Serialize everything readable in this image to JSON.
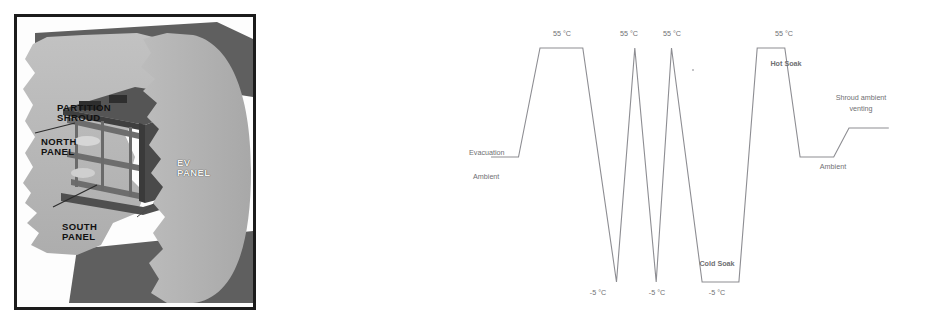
{
  "figure": {
    "panels": 2
  },
  "left_panel": {
    "name": "spacecraft-shroud-cutaway",
    "labels": {
      "partition_shroud": "PARTITION\nSHROUD",
      "north_panel": "NORTH\nPANEL",
      "ev_panel": "EV\nPANEL",
      "south_panel": "SOUTH\nPANEL",
      "front_shroud": "FRONT\nSHROUD"
    },
    "colors": {
      "frame": "#1b1b1b",
      "light_gray": "#b7b7b7",
      "mid_gray": "#9a9a9a",
      "dark_gray": "#6d6d6d",
      "darkest_gray": "#4a4a4a",
      "background": "#fdfdfd"
    }
  },
  "chart_data": {
    "type": "line",
    "title": "",
    "xlabel": "",
    "ylabel": "",
    "grid": false,
    "legend": null,
    "axis_visible": false,
    "ylim": [
      -5,
      55
    ],
    "levels": {
      "hot": "55 °C",
      "cold": "-5 °C",
      "ambient": "Ambient",
      "vent": "Shroud ambient venting"
    },
    "series": [
      {
        "name": "Shroud temperature profile",
        "color": "#8d8d92",
        "points": [
          {
            "x": 0,
            "y": "ambient",
            "label": "Ambient start"
          },
          {
            "x": 9,
            "y": "ambient",
            "label": "Evacuation"
          },
          {
            "x": 16,
            "y": 55,
            "label": "ramp up"
          },
          {
            "x": 30,
            "y": 55,
            "label": "55 °C hold"
          },
          {
            "x": 41,
            "y": -5,
            "label": "-5 °C spike 1"
          },
          {
            "x": 47,
            "y": 55,
            "label": "55 °C spike 1"
          },
          {
            "x": 54,
            "y": -5,
            "label": "-5 °C spike 2"
          },
          {
            "x": 59,
            "y": 55,
            "label": "55 °C spike 2"
          },
          {
            "x": 69,
            "y": -5,
            "label": "Cold Soak start"
          },
          {
            "x": 81,
            "y": -5,
            "label": "Cold Soak end"
          },
          {
            "x": 87,
            "y": 55,
            "label": "Hot Soak start"
          },
          {
            "x": 96,
            "y": 55,
            "label": "Hot Soak end"
          },
          {
            "x": 101,
            "y": "ambient",
            "label": "Ambient return"
          },
          {
            "x": 112,
            "y": "ambient",
            "label": "Ambient hold"
          },
          {
            "x": 117,
            "y": "vent",
            "label": "Shroud ambient venting"
          },
          {
            "x": 130,
            "y": "vent",
            "label": "end"
          }
        ]
      }
    ],
    "annotations": [
      {
        "id": "evacuation",
        "text": "Evacuation",
        "x": 18,
        "y": 154
      },
      {
        "id": "ambient-left",
        "text": "Ambient",
        "x": 22,
        "y": 177
      },
      {
        "id": "hot-1",
        "text": "55 °C",
        "x": 96,
        "y": 33
      },
      {
        "id": "hot-2",
        "text": "55 °C",
        "x": 163,
        "y": 33
      },
      {
        "id": "hot-3",
        "text": "55 °C",
        "x": 206,
        "y": 33
      },
      {
        "id": "hot-4",
        "text": "55 °C",
        "x": 318,
        "y": 33
      },
      {
        "id": "cold-1",
        "text": "-5 °C",
        "x": 132,
        "y": 292
      },
      {
        "id": "cold-2",
        "text": "-5 °C",
        "x": 191,
        "y": 292
      },
      {
        "id": "cold-3",
        "text": "-5 °C",
        "x": 251,
        "y": 292
      },
      {
        "id": "hot-soak",
        "text": "Hot Soak",
        "x": 320,
        "y": 63
      },
      {
        "id": "cold-soak",
        "text": "Cold Soak",
        "x": 251,
        "y": 263
      },
      {
        "id": "venting",
        "text": "Shroud ambient\nventing",
        "x": 395,
        "y": 96
      },
      {
        "id": "ambient-right",
        "text": "Ambient",
        "x": 367,
        "y": 166
      }
    ]
  }
}
